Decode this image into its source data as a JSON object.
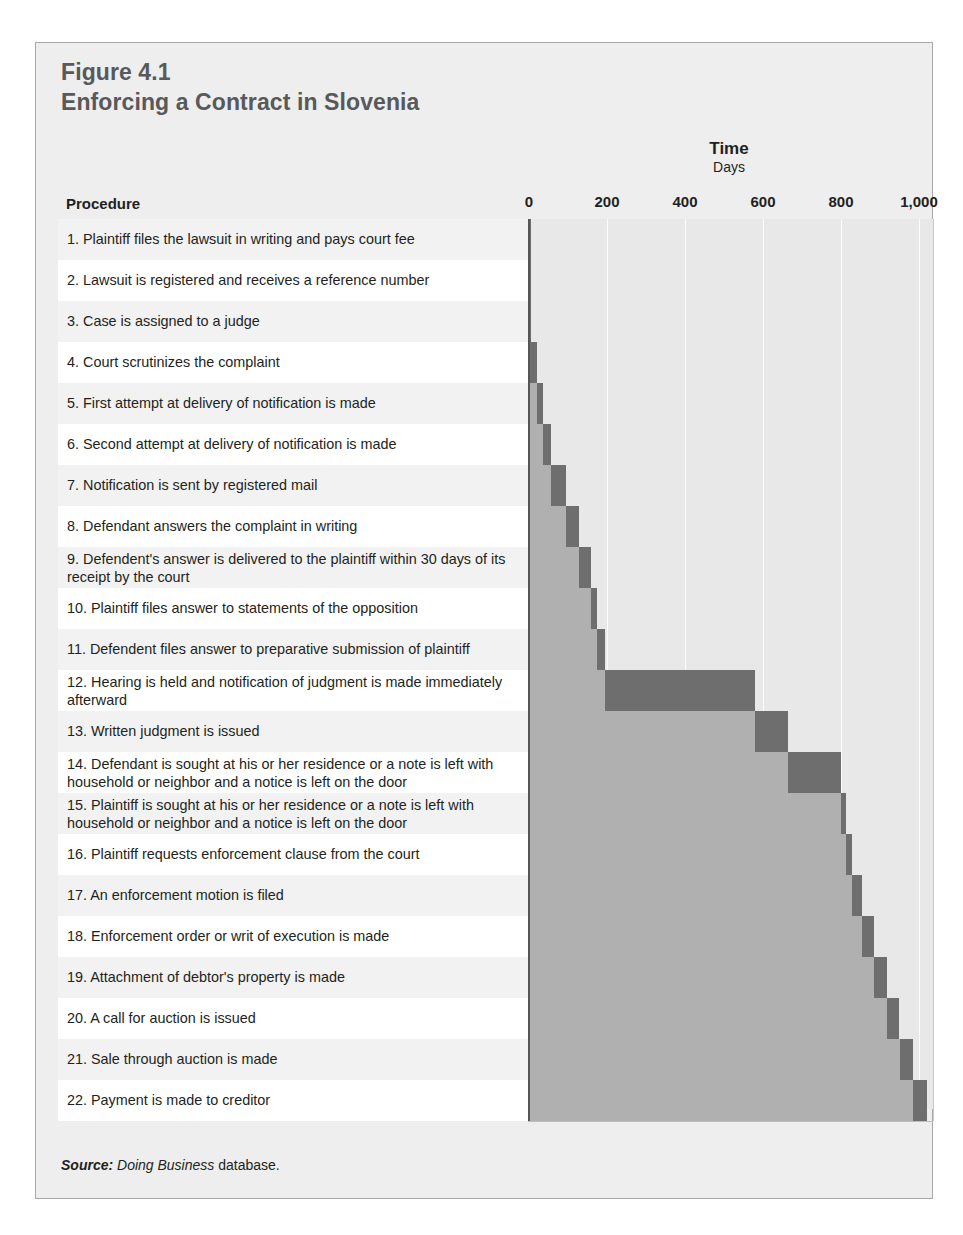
{
  "figure": {
    "number_label": "Figure 4.1",
    "title": "Enforcing a Contract in Slovenia",
    "procedure_header": "Procedure",
    "source_prefix": "Source:",
    "source_italic": "Doing Business",
    "source_suffix": "database.",
    "colors": {
      "panel_bg": "#eeeeee",
      "panel_border": "#a8a8a8",
      "title_gray": "#58595b",
      "plot_bg": "#e8e8e8",
      "gridline": "#fbfbfb",
      "axis_line": "#55565a",
      "bar_elapsed": "#b0b0b0",
      "bar_active": "#6e6e6e",
      "row_white": "#ffffff",
      "row_shade": "#f2f2f2",
      "text": "#231f20"
    }
  },
  "chart_data": {
    "type": "bar",
    "chart_kind": "gantt-cascade",
    "title": "Enforcing a Contract in Slovenia",
    "subtitle": "Figure 4.1",
    "xlabel": "Time",
    "xlabel_units": "Days",
    "ylabel": "Procedure",
    "xlim": [
      0,
      1050
    ],
    "grid": true,
    "legend": "none",
    "tick_values": [
      0,
      200,
      400,
      600,
      800,
      1000
    ],
    "tick_labels": [
      "0",
      "200",
      "400",
      "600",
      "800",
      "1,000"
    ],
    "categories": [
      "1. Plaintiff files the lawsuit in writing and pays court fee",
      "2. Lawsuit is registered and receives a reference number",
      "3. Case is assigned to a judge",
      "4. Court scrutinizes the complaint",
      "5. First attempt at delivery of notification is made",
      "6. Second attempt at delivery of notification is made",
      "7. Notification is sent by registered mail",
      "8. Defendant answers the complaint in writing",
      "9. Defendent's answer is delivered to the plaintiff within 30 days of its receipt by the court",
      "10. Plaintiff files answer to statements of the opposition",
      "11. Defendent files answer to preparative submission of plaintiff",
      "12. Hearing is held and notification of judgment is made immediately afterward",
      "13. Written judgment is issued",
      "14. Defendant is sought at his or her residence or a note is left with household or neighbor and a notice is left on the door",
      "15. Plaintiff is sought at his or her residence or a note is left with household or neighbor and a notice is left on the door",
      "16. Plaintiff requests enforcement clause from the court",
      "17. An enforcement motion is filed",
      "18. Enforcement order or writ of execution is made",
      "19. Attachment of debtor's property is made",
      "20. A call for auction is issued",
      "21. Sale through auction is made",
      "22. Payment is made to creditor"
    ],
    "rows": [
      {
        "n": 1,
        "label": "1. Plaintiff files the lawsuit in writing and pays court fee",
        "start": 0,
        "end": 1,
        "lines": 1
      },
      {
        "n": 2,
        "label": "2. Lawsuit is registered and receives a reference number",
        "start": 1,
        "end": 2,
        "lines": 1
      },
      {
        "n": 3,
        "label": "3. Case is assigned to a judge",
        "start": 2,
        "end": 3,
        "lines": 1
      },
      {
        "n": 4,
        "label": "4. Court scrutinizes the complaint",
        "start": 3,
        "end": 20,
        "lines": 1
      },
      {
        "n": 5,
        "label": "5. First attempt at delivery of notification is made",
        "start": 20,
        "end": 37,
        "lines": 1
      },
      {
        "n": 6,
        "label": "6. Second attempt at delivery of notification is made",
        "start": 37,
        "end": 57,
        "lines": 1
      },
      {
        "n": 7,
        "label": "7. Notification is sent by registered mail",
        "start": 57,
        "end": 95,
        "lines": 1
      },
      {
        "n": 8,
        "label": "8. Defendant answers the complaint in writing",
        "start": 95,
        "end": 128,
        "lines": 1
      },
      {
        "n": 9,
        "label": "9. Defendent's answer is delivered to the plaintiff within 30 days of its receipt by the court",
        "start": 128,
        "end": 160,
        "lines": 2
      },
      {
        "n": 10,
        "label": "10. Plaintiff files answer to statements of the opposition",
        "start": 160,
        "end": 175,
        "lines": 1
      },
      {
        "n": 11,
        "label": "11. Defendent files answer to preparative submission of plaintiff",
        "start": 175,
        "end": 195,
        "lines": 1
      },
      {
        "n": 12,
        "label": "12. Hearing is held and notification of judgment is made immediately afterward",
        "start": 195,
        "end": 580,
        "lines": 2
      },
      {
        "n": 13,
        "label": "13. Written judgment is issued",
        "start": 580,
        "end": 665,
        "lines": 1
      },
      {
        "n": 14,
        "label": "14. Defendant is sought at his or her residence or a note is left with household or neighbor and a notice is left on the door",
        "start": 665,
        "end": 800,
        "lines": 2
      },
      {
        "n": 15,
        "label": "15. Plaintiff is sought at his or her residence or a note is left with household or neighbor and a notice is left on the door",
        "start": 800,
        "end": 812,
        "lines": 2
      },
      {
        "n": 16,
        "label": "16. Plaintiff requests enforcement clause from the court",
        "start": 812,
        "end": 828,
        "lines": 1
      },
      {
        "n": 17,
        "label": "17. An enforcement motion is filed",
        "start": 828,
        "end": 855,
        "lines": 1
      },
      {
        "n": 18,
        "label": "18. Enforcement order or writ of execution is made",
        "start": 855,
        "end": 885,
        "lines": 1
      },
      {
        "n": 19,
        "label": "19. Attachment of debtor's property is made",
        "start": 885,
        "end": 917,
        "lines": 1
      },
      {
        "n": 20,
        "label": "20. A call for auction is issued",
        "start": 917,
        "end": 950,
        "lines": 1
      },
      {
        "n": 21,
        "label": "21. Sale through auction is made",
        "start": 950,
        "end": 985,
        "lines": 1
      },
      {
        "n": 22,
        "label": "22. Payment is made to creditor",
        "start": 985,
        "end": 1020,
        "lines": 1
      }
    ]
  }
}
